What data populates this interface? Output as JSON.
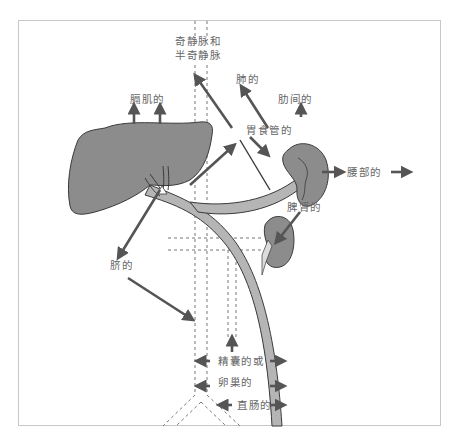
{
  "diagram": {
    "type": "anatomical-venous-drainage",
    "colors": {
      "organ_fill": "#8c8c8c",
      "organ_stroke": "#3a3a3a",
      "vein_fill": "#b5b5b5",
      "arrow": "#555555",
      "dashed_line": "#777777",
      "label_text": "#666666",
      "frame": "#c8c8c8"
    },
    "labels": {
      "azygos_line1": "奇静脉和",
      "azygos_line2": "半奇静脉",
      "phrenic": "膈肌的",
      "pulmonary": "肺的",
      "intercostal": "肋间的",
      "gastroesophageal": "胃食管的",
      "lumbar": "腰部的",
      "splenorenal": "脾肾的",
      "umbilical": "脐的",
      "gonadal_line1": "精囊的或",
      "gonadal_line2": "卵巢的",
      "rectal": "直肠的"
    },
    "organs": [
      "liver",
      "spleen",
      "kidney",
      "portal-vein",
      "splenic-vein"
    ]
  }
}
